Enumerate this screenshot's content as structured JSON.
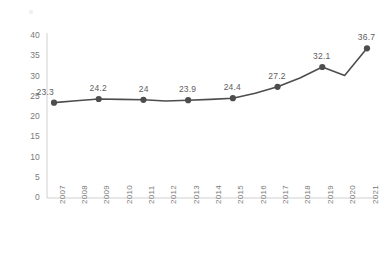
{
  "chart_data": {
    "type": "line",
    "title": "",
    "subtitle": "",
    "xlabel": "",
    "ylabel": "",
    "categories": [
      "2007",
      "2008",
      "2009",
      "2010",
      "2011",
      "2012",
      "2013",
      "2014",
      "2015",
      "2016",
      "2017",
      "2018",
      "2019",
      "2020",
      "2021"
    ],
    "values": [
      23.3,
      23.75,
      24.2,
      24.1,
      24,
      23.7,
      23.9,
      24.1,
      24.4,
      25.6,
      27.2,
      29.4,
      32.1,
      30.0,
      36.7
    ],
    "labeled_points": [
      {
        "category": "2007",
        "value": 23.3,
        "label": "23.3"
      },
      {
        "category": "2009",
        "value": 24.2,
        "label": "24.2"
      },
      {
        "category": "2011",
        "value": 24,
        "label": "24"
      },
      {
        "category": "2013",
        "value": 23.9,
        "label": "23.9"
      },
      {
        "category": "2015",
        "value": 24.4,
        "label": "24.4"
      },
      {
        "category": "2017",
        "value": 27.2,
        "label": "27.2"
      },
      {
        "category": "2019",
        "value": 32.1,
        "label": "32.1"
      },
      {
        "category": "2021",
        "value": 36.7,
        "label": "36.7"
      }
    ],
    "yticks": [
      "0",
      "5",
      "10",
      "15",
      "20",
      "25",
      "30",
      "35",
      "40"
    ],
    "ylim": [
      0,
      40
    ],
    "grid": false,
    "legend": null,
    "series_color": "#4d4d4d",
    "axis_color": "#d0d0d0",
    "tick_text_color": "#7a7a7a",
    "label_text_color": "#5e5e5e",
    "marker_shape": "circle",
    "xtick_rotation": "-90"
  }
}
